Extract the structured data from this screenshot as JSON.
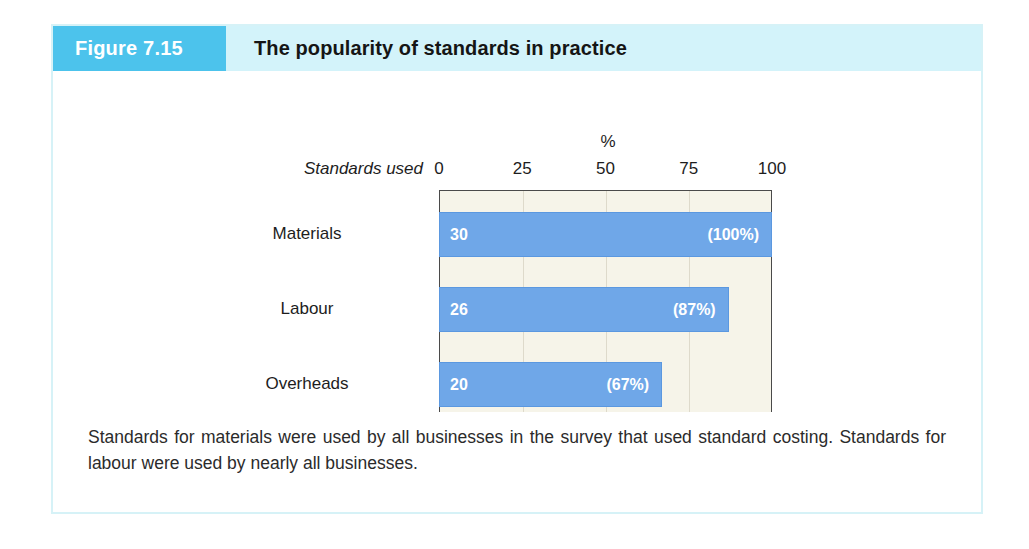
{
  "figure": {
    "badge_label": "Figure 7.15",
    "title": "The popularity of standards in practice",
    "badge_color": "#4cc3ec",
    "header_band_color": "#d3f3fa",
    "card_border_color": "#d6f2f7"
  },
  "chart_data": {
    "type": "bar",
    "orientation": "horizontal",
    "title": "The popularity of standards in practice",
    "categories": [
      "Materials",
      "Labour",
      "Overheads"
    ],
    "values": [
      100,
      87,
      67
    ],
    "counts": [
      30,
      26,
      20
    ],
    "count_labels": [
      "30",
      "26",
      "20"
    ],
    "pct_labels": [
      "(100%)",
      "(87%)",
      "(67%)"
    ],
    "xlabel": "%",
    "ylabel": "Standards used",
    "xlim": [
      0,
      100
    ],
    "xticks": [
      0,
      25,
      50,
      75,
      100
    ],
    "xtick_labels": [
      "0",
      "25",
      "50",
      "75",
      "100"
    ],
    "grid": true,
    "grid_axis": "x",
    "legend": false,
    "bar_color": "#6fa7e8",
    "plot_background": "#f6f4e9"
  },
  "caption": {
    "text": "Standards for materials were used by all businesses in the survey that used standard costing. Standards for labour were used by nearly all businesses."
  }
}
